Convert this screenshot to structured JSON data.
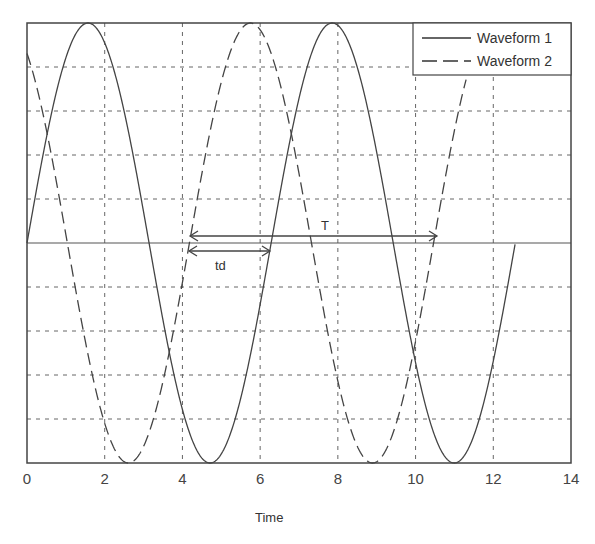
{
  "chart_data": {
    "type": "line",
    "title": "",
    "xlabel": "Time",
    "ylabel": "",
    "xlim": [
      0,
      14
    ],
    "ylim": [
      -1,
      1
    ],
    "x_ticks": [
      "0",
      "2",
      "4",
      "6",
      "8",
      "10",
      "12",
      "14"
    ],
    "y_ticks": [],
    "grid": true,
    "legend_position": "upper right",
    "series": [
      {
        "name": "Waveform 1",
        "style": "solid",
        "function": "sin(t)",
        "t_range": [
          0,
          12.57
        ],
        "x": [
          0,
          1.57,
          3.14,
          4.71,
          6.28,
          7.85,
          9.42,
          11.0,
          12.57
        ],
        "values": [
          0,
          1,
          0,
          -1,
          0,
          1,
          0,
          -1,
          0
        ]
      },
      {
        "name": "Waveform 2",
        "style": "dashed",
        "function": "sin(t - 4.18)",
        "t_range": [
          0,
          11.3
        ],
        "x": [
          0,
          0.53,
          2.6,
          4.18,
          5.75,
          7.32,
          8.9,
          10.46
        ],
        "values": [
          0.87,
          1,
          -1,
          0,
          1,
          0,
          -1,
          0
        ]
      }
    ],
    "annotations": [
      {
        "text": "T",
        "type": "double-arrow",
        "from_t": 4.2,
        "to_t": 10.55,
        "meaning": "period"
      },
      {
        "text": "td",
        "type": "double-arrow",
        "from_t": 4.15,
        "to_t": 6.25,
        "meaning": "time delay"
      }
    ]
  },
  "legend": {
    "items": [
      {
        "label": "Waveform 1"
      },
      {
        "label": "Waveform 2"
      }
    ]
  },
  "axis": {
    "xlabel": "Time"
  },
  "annotations": {
    "period_label": "T",
    "delay_label": "td"
  }
}
